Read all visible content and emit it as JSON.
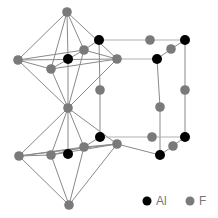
{
  "figure": {
    "colors": {
      "al": "#000000",
      "f": "#7a7a7a",
      "bond": "#8a8a8a"
    },
    "atoms": [
      {
        "id": "f_top",
        "el": "F",
        "x": 67,
        "y": 12
      },
      {
        "id": "f_ul_left",
        "el": "F",
        "x": 18,
        "y": 60
      },
      {
        "id": "f_ul_front",
        "el": "F",
        "x": 51,
        "y": 69
      },
      {
        "id": "f_ul_back",
        "el": "F",
        "x": 84,
        "y": 50
      },
      {
        "id": "f_ul_right",
        "el": "F",
        "x": 117,
        "y": 59
      },
      {
        "id": "al_upper_center",
        "el": "Al",
        "x": 68,
        "y": 59
      },
      {
        "id": "f_mid",
        "el": "F",
        "x": 68,
        "y": 108
      },
      {
        "id": "f_ll_left",
        "el": "F",
        "x": 19,
        "y": 156
      },
      {
        "id": "f_ll_front",
        "el": "F",
        "x": 51,
        "y": 155
      },
      {
        "id": "f_ll_back",
        "el": "F",
        "x": 84,
        "y": 147
      },
      {
        "id": "f_ll_right",
        "el": "F",
        "x": 117,
        "y": 144
      },
      {
        "id": "al_lower_center",
        "el": "Al",
        "x": 68,
        "y": 154
      },
      {
        "id": "f_bottom",
        "el": "F",
        "x": 69,
        "y": 205
      },
      {
        "id": "al_top_back_left",
        "el": "Al",
        "x": 99,
        "y": 40
      },
      {
        "id": "al_top_back_right",
        "el": "Al",
        "x": 185,
        "y": 40
      },
      {
        "id": "al_top_front_right",
        "el": "Al",
        "x": 157,
        "y": 59
      },
      {
        "id": "f_top_back_edge",
        "el": "F",
        "x": 150,
        "y": 40
      },
      {
        "id": "f_top_right_edge",
        "el": "F",
        "x": 171,
        "y": 49
      },
      {
        "id": "f_vert_back_left",
        "el": "F",
        "x": 100,
        "y": 90
      },
      {
        "id": "f_vert_front_right",
        "el": "F",
        "x": 160,
        "y": 107
      },
      {
        "id": "f_vert_back_right",
        "el": "F",
        "x": 185,
        "y": 90
      },
      {
        "id": "al_bot_back_left",
        "el": "Al",
        "x": 100,
        "y": 137
      },
      {
        "id": "al_bot_back_right",
        "el": "Al",
        "x": 185,
        "y": 137
      },
      {
        "id": "al_bot_front_right",
        "el": "Al",
        "x": 160,
        "y": 155
      },
      {
        "id": "f_bot_back_edge",
        "el": "F",
        "x": 152,
        "y": 137
      },
      {
        "id": "f_bot_right_edge",
        "el": "F",
        "x": 173,
        "y": 146
      }
    ],
    "bonds": [
      [
        "f_top",
        "f_ul_left"
      ],
      [
        "f_top",
        "f_ul_front"
      ],
      [
        "f_top",
        "f_ul_back"
      ],
      [
        "f_top",
        "f_ul_right"
      ],
      [
        "f_top",
        "al_upper_center"
      ],
      [
        "f_mid",
        "f_ul_left"
      ],
      [
        "f_mid",
        "f_ul_front"
      ],
      [
        "f_mid",
        "f_ul_back"
      ],
      [
        "f_mid",
        "f_ul_right"
      ],
      [
        "f_mid",
        "al_upper_center"
      ],
      [
        "f_ul_left",
        "f_ul_front"
      ],
      [
        "f_ul_front",
        "f_ul_right"
      ],
      [
        "f_ul_right",
        "f_ul_back"
      ],
      [
        "f_ul_back",
        "f_ul_left"
      ],
      [
        "f_ul_left",
        "f_ul_right"
      ],
      [
        "f_ul_front",
        "f_ul_back"
      ],
      [
        "f_mid",
        "f_ll_left"
      ],
      [
        "f_mid",
        "f_ll_front"
      ],
      [
        "f_mid",
        "f_ll_back"
      ],
      [
        "f_mid",
        "f_ll_right"
      ],
      [
        "f_mid",
        "al_lower_center"
      ],
      [
        "f_bottom",
        "f_ll_left"
      ],
      [
        "f_bottom",
        "f_ll_front"
      ],
      [
        "f_bottom",
        "f_ll_back"
      ],
      [
        "f_bottom",
        "f_ll_right"
      ],
      [
        "f_ll_left",
        "f_ll_front"
      ],
      [
        "f_ll_front",
        "f_ll_right"
      ],
      [
        "f_ll_right",
        "f_ll_back"
      ],
      [
        "f_ll_back",
        "f_ll_left"
      ],
      [
        "f_ll_left",
        "f_ll_right"
      ],
      [
        "f_ll_front",
        "f_ll_back"
      ],
      [
        "al_top_back_left",
        "f_ul_back"
      ],
      [
        "al_top_back_left",
        "f_top_back_edge"
      ],
      [
        "f_top_back_edge",
        "al_top_back_right"
      ],
      [
        "al_top_back_right",
        "f_top_right_edge"
      ],
      [
        "f_top_right_edge",
        "al_top_front_right"
      ],
      [
        "al_top_front_right",
        "f_ul_right"
      ],
      [
        "al_top_back_left",
        "f_vert_back_left"
      ],
      [
        "f_vert_back_left",
        "al_bot_back_left"
      ],
      [
        "al_top_front_right",
        "f_vert_front_right"
      ],
      [
        "f_vert_front_right",
        "al_bot_front_right"
      ],
      [
        "al_top_back_right",
        "f_vert_back_right"
      ],
      [
        "f_vert_back_right",
        "al_bot_back_right"
      ],
      [
        "al_bot_back_left",
        "f_ll_back"
      ],
      [
        "al_bot_back_left",
        "f_bot_back_edge"
      ],
      [
        "f_bot_back_edge",
        "al_bot_back_right"
      ],
      [
        "al_bot_back_right",
        "f_bot_right_edge"
      ],
      [
        "f_bot_right_edge",
        "al_bot_front_right"
      ],
      [
        "al_bot_front_right",
        "f_ll_right"
      ]
    ]
  },
  "legend": {
    "items": [
      {
        "label": "Al",
        "color": "#000000"
      },
      {
        "label": "F",
        "color": "#7a7a7a"
      }
    ]
  }
}
